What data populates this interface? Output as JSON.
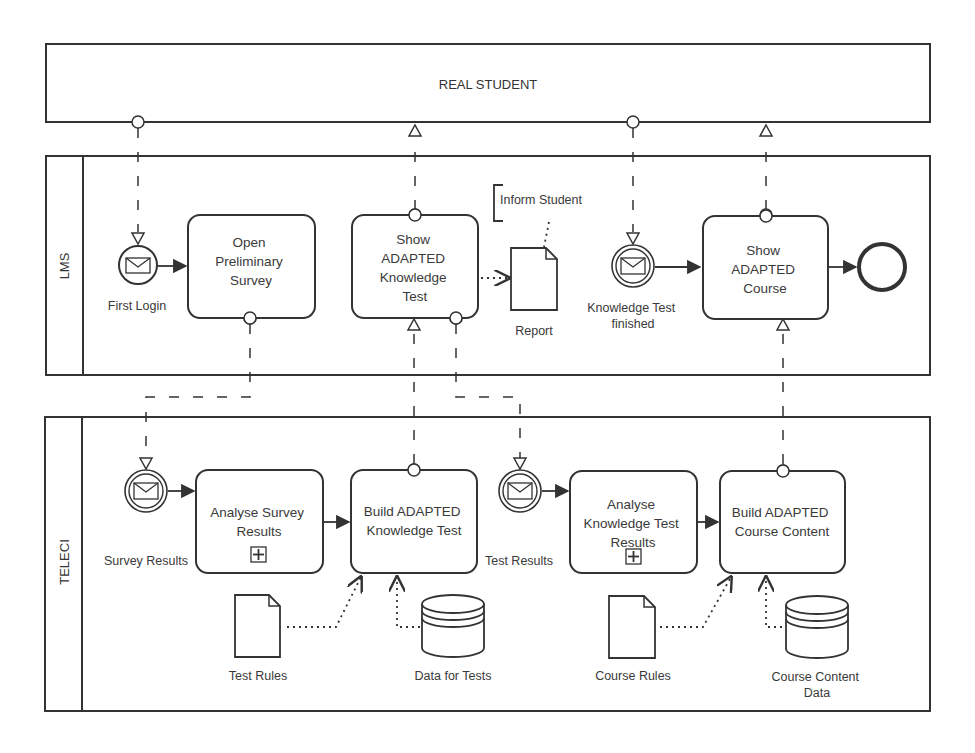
{
  "diagram": {
    "type": "BPMN collaboration",
    "colors": {
      "line": "#333333",
      "text": "#3a3a3a",
      "background": "#ffffff"
    },
    "pools": [
      {
        "id": "real-student",
        "label": "REAL STUDENT"
      },
      {
        "id": "lms",
        "label": "LMS"
      },
      {
        "id": "teleci",
        "label": "TELECI"
      }
    ],
    "lms": {
      "start_event": {
        "label": "First Login",
        "icon": "envelope-icon"
      },
      "task_open_survey": {
        "lines": [
          "Open",
          "Preliminary",
          "Survey"
        ]
      },
      "task_show_test": {
        "lines": [
          "Show",
          "ADAPTED",
          "Knowledge",
          "Test"
        ]
      },
      "annotation": {
        "text": "Inform Student"
      },
      "data_object_report": {
        "label": "Report"
      },
      "intermediate_event": {
        "lines": [
          "Knowledge Test",
          "finished"
        ],
        "icon": "envelope-icon"
      },
      "task_show_course": {
        "lines": [
          "Show",
          "ADAPTED",
          "Course"
        ]
      },
      "end_event": {
        "label": ""
      }
    },
    "teleci": {
      "event_survey_results": {
        "label": "Survey Results",
        "icon": "envelope-icon"
      },
      "task_analyse_survey": {
        "lines": [
          "Analyse Survey",
          "Results"
        ],
        "marker": "+"
      },
      "task_build_test": {
        "lines": [
          "Build ADAPTED",
          "Knowledge Test"
        ]
      },
      "event_test_results": {
        "label": "Test Results",
        "icon": "envelope-icon"
      },
      "task_analyse_test": {
        "lines": [
          "Analyse",
          "Knowledge Test",
          "Results"
        ],
        "marker": "+"
      },
      "task_build_course": {
        "lines": [
          "Build ADAPTED",
          "Course Content"
        ]
      },
      "data_object_test_rules": {
        "label": "Test Rules"
      },
      "data_store_tests": {
        "label": "Data for Tests"
      },
      "data_object_course_rules": {
        "label": "Course Rules"
      },
      "data_store_course": {
        "lines": [
          "Course Content",
          "Data"
        ]
      }
    }
  }
}
